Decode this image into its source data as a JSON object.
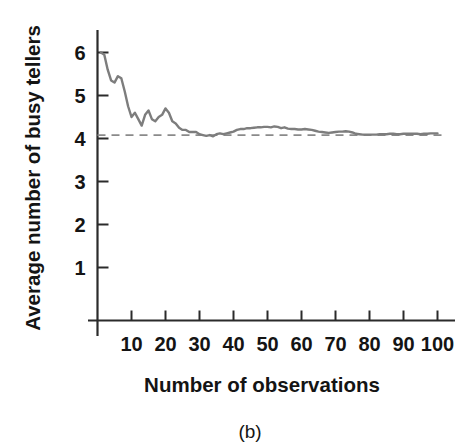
{
  "figure": {
    "caption": "(b)",
    "background_color": "#ffffff",
    "line_color": "#7d7d7d",
    "axis_color": "#2b2b2b",
    "reference_line_color": "#8a8a8a"
  },
  "chart_data": {
    "type": "line",
    "title": "",
    "xlabel": "Number of observations",
    "ylabel": "Average number of busy tellers",
    "xlim": [
      0,
      103
    ],
    "ylim": [
      0,
      6.45
    ],
    "grid": false,
    "legend": null,
    "xticks": [
      10,
      20,
      30,
      40,
      50,
      60,
      70,
      80,
      90,
      100
    ],
    "xtick_labels": [
      "10",
      "20",
      "30",
      "40",
      "50",
      "60",
      "70",
      "80",
      "90",
      "100"
    ],
    "yticks": [
      1,
      2,
      3,
      4,
      5,
      6
    ],
    "ytick_labels": [
      "1",
      "2",
      "3",
      "4",
      "5",
      "6"
    ],
    "reference_line": {
      "orientation": "horizontal",
      "value": 4.08,
      "style": "dashed",
      "label": ""
    },
    "series": [
      {
        "name": "Cumulative average number of busy tellers",
        "x": [
          1,
          2,
          3,
          4,
          5,
          6,
          7,
          8,
          9,
          10,
          11,
          12,
          13,
          14,
          15,
          16,
          17,
          18,
          19,
          20,
          21,
          22,
          23,
          24,
          25,
          26,
          27,
          28,
          29,
          30,
          31,
          32,
          33,
          34,
          35,
          36,
          37,
          38,
          39,
          40,
          41,
          42,
          43,
          44,
          45,
          46,
          47,
          48,
          49,
          50,
          51,
          52,
          53,
          54,
          55,
          56,
          57,
          58,
          59,
          60,
          61,
          62,
          63,
          64,
          65,
          66,
          67,
          68,
          69,
          70,
          71,
          72,
          73,
          74,
          75,
          76,
          77,
          78,
          79,
          80,
          81,
          82,
          83,
          84,
          85,
          86,
          87,
          88,
          89,
          90,
          91,
          92,
          93,
          94,
          95,
          96,
          97,
          98,
          99,
          100
        ],
        "y": [
          6.0,
          5.95,
          5.6,
          5.35,
          5.3,
          5.45,
          5.4,
          5.1,
          4.75,
          4.5,
          4.6,
          4.45,
          4.3,
          4.55,
          4.65,
          4.45,
          4.4,
          4.5,
          4.55,
          4.7,
          4.6,
          4.4,
          4.35,
          4.25,
          4.2,
          4.2,
          4.15,
          4.15,
          4.15,
          4.1,
          4.08,
          4.06,
          4.08,
          4.05,
          4.1,
          4.12,
          4.1,
          4.12,
          4.14,
          4.16,
          4.2,
          4.22,
          4.22,
          4.24,
          4.24,
          4.25,
          4.26,
          4.26,
          4.27,
          4.27,
          4.26,
          4.28,
          4.27,
          4.24,
          4.26,
          4.23,
          4.22,
          4.22,
          4.21,
          4.21,
          4.22,
          4.21,
          4.2,
          4.18,
          4.16,
          4.15,
          4.14,
          4.13,
          4.14,
          4.15,
          4.16,
          4.16,
          4.17,
          4.16,
          4.14,
          4.11,
          4.1,
          4.09,
          4.09,
          4.09,
          4.09,
          4.09,
          4.1,
          4.1,
          4.1,
          4.11,
          4.11,
          4.1,
          4.1,
          4.11,
          4.11,
          4.11,
          4.11,
          4.11,
          4.1,
          4.11,
          4.11,
          4.12,
          4.12,
          4.12
        ]
      }
    ]
  }
}
